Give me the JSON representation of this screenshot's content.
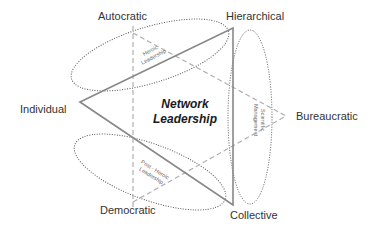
{
  "diagram": {
    "title": "Network Leadership",
    "center_label_line1": "Network",
    "center_label_line2": "Leadership",
    "vertices": {
      "autocratic": "Autocratic",
      "hierarchical": "Hierarchical",
      "individual": "Individual",
      "bureaucratic": "Bureaucratic",
      "democratic": "Democratic",
      "collective": "Collective"
    },
    "regions": {
      "heroic_line1": "Heroic",
      "heroic_line2": "Leadership",
      "scientific_line1": "Scientific",
      "scientific_line2": "Management",
      "postheroic_line1": "Post - Heroic",
      "postheroic_line2": "Leadership"
    },
    "colors": {
      "solid_triangle": "#888888",
      "dashed_triangle": "#b0b0b0",
      "ellipse": "#555555",
      "text": "#333333"
    }
  }
}
